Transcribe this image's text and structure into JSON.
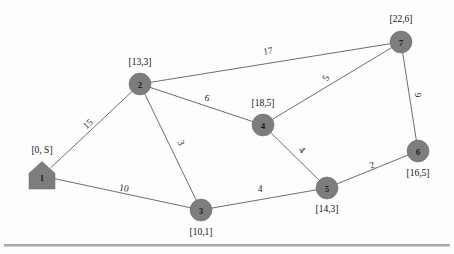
{
  "diagram": {
    "colors": {
      "node_fill": "#7d7d7d",
      "edge_stroke": "#6e6e6e",
      "text": "#111111",
      "rule": "#9a9a9a"
    },
    "nodes": [
      {
        "id": "1",
        "label": "1",
        "tag": "[0, S]",
        "shape": "pentagon",
        "cx": 42,
        "cy": 176,
        "r": 13,
        "tag_x": 42,
        "tag_y": 150
      },
      {
        "id": "2",
        "label": "2",
        "tag": "[13,3]",
        "shape": "circle",
        "cx": 140,
        "cy": 84,
        "r": 11,
        "tag_x": 140,
        "tag_y": 62
      },
      {
        "id": "3",
        "label": "3",
        "tag": "[10,1]",
        "shape": "circle",
        "cx": 201,
        "cy": 210,
        "r": 11,
        "tag_x": 201,
        "tag_y": 232
      },
      {
        "id": "4",
        "label": "4",
        "tag": "[18,5]",
        "shape": "circle",
        "cx": 263,
        "cy": 125,
        "r": 11,
        "tag_x": 263,
        "tag_y": 103
      },
      {
        "id": "5",
        "label": "5",
        "tag": "[14,3]",
        "shape": "circle",
        "cx": 327,
        "cy": 188,
        "r": 11,
        "tag_x": 327,
        "tag_y": 209
      },
      {
        "id": "6",
        "label": "6",
        "tag": "[16,5]",
        "shape": "circle",
        "cx": 418,
        "cy": 151,
        "r": 11,
        "tag_x": 418,
        "tag_y": 173
      },
      {
        "id": "7",
        "label": "7",
        "tag": "[22,6]",
        "shape": "circle",
        "cx": 401,
        "cy": 42,
        "r": 11,
        "tag_x": 401,
        "tag_y": 19
      }
    ],
    "edges": [
      {
        "from": "1",
        "to": "2",
        "weight": "15",
        "lx": 88,
        "ly": 124,
        "rot": -43
      },
      {
        "from": "1",
        "to": "3",
        "weight": "10",
        "lx": 124,
        "ly": 188,
        "rot": 10
      },
      {
        "from": "2",
        "to": "3",
        "weight": "3",
        "lx": 181,
        "ly": 143,
        "rot": 65
      },
      {
        "from": "2",
        "to": "4",
        "weight": "6",
        "lx": 207,
        "ly": 98,
        "rot": 16
      },
      {
        "from": "2",
        "to": "7",
        "weight": "17",
        "lx": 268,
        "ly": 51,
        "rot": -9
      },
      {
        "from": "3",
        "to": "5",
        "weight": "4",
        "lx": 260,
        "ly": 189,
        "rot": 0
      },
      {
        "from": "4",
        "to": "5",
        "weight": "4",
        "lx": 302,
        "ly": 150,
        "rot": 45
      },
      {
        "from": "4",
        "to": "7",
        "weight": "5",
        "lx": 326,
        "ly": 78,
        "rot": -62
      },
      {
        "from": "5",
        "to": "6",
        "weight": "2",
        "lx": 372,
        "ly": 165,
        "rot": -20
      },
      {
        "from": "6",
        "to": "7",
        "weight": "6",
        "lx": 418,
        "ly": 95,
        "rot": -88
      }
    ],
    "footer_rule": true
  }
}
